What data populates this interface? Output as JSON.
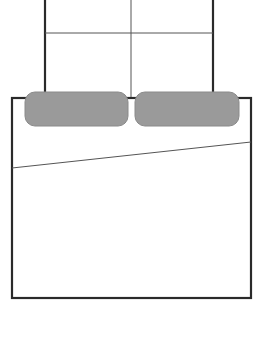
{
  "diagram": {
    "type": "floor-plan-furniture",
    "colors": {
      "background": "#ffffff",
      "stroke": "#2a2a2a",
      "thin_stroke": "#555555",
      "pillow_fill": "#9a9a9a",
      "pillow_stroke": "#8a8a8a"
    },
    "headboard": {
      "x": 45,
      "y": 0,
      "width": 168,
      "height": 98,
      "divider_x": 131,
      "cross_y": 33
    },
    "frame": {
      "x": 12,
      "y": 98,
      "width": 239,
      "height": 200
    },
    "pillows": [
      {
        "x": 25,
        "y": 92,
        "width": 103,
        "height": 34,
        "rx": 10
      },
      {
        "x": 135,
        "y": 92,
        "width": 104,
        "height": 34,
        "rx": 10
      }
    ],
    "blanket_fold": {
      "x1": 12,
      "y1": 168,
      "x2": 251,
      "y2": 142
    }
  }
}
